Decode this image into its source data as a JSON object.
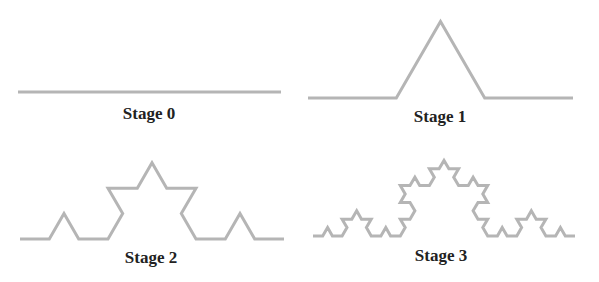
{
  "diagram": {
    "stroke_color": "#b5b5b5",
    "stroke_width": 3,
    "label_color": "#222222",
    "stages": [
      {
        "label": "Stage 0",
        "iterations": 0,
        "start": [
          18,
          92
        ],
        "end": [
          281,
          92
        ],
        "label_pos": [
          149,
          105
        ]
      },
      {
        "label": "Stage 1",
        "iterations": 1,
        "start": [
          308,
          98
        ],
        "end": [
          573,
          98
        ],
        "label_pos": [
          440,
          108
        ]
      },
      {
        "label": "Stage 2",
        "iterations": 2,
        "start": [
          20,
          239
        ],
        "end": [
          284,
          239
        ],
        "label_pos": [
          151,
          249
        ]
      },
      {
        "label": "Stage 3",
        "iterations": 3,
        "start": [
          313,
          236
        ],
        "end": [
          575,
          236
        ],
        "label_pos": [
          441,
          247
        ]
      }
    ]
  }
}
